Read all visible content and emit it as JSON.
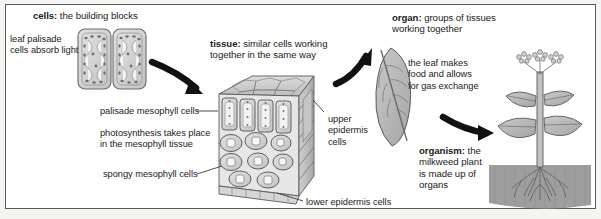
{
  "figure": {
    "background_color": "#ffffff",
    "border_color": "#5b5b58",
    "ink_color": "#1b1b1b",
    "arrow_color": "#111111",
    "art_gray": "#b4b4b4",
    "art_outline": "#5a5a5a",
    "soil_gray": "#9a9a9a"
  },
  "stages": {
    "cells": {
      "heading_term": "cells:",
      "heading_rest": " the building blocks",
      "note": "leaf palisade\ncells absorb light",
      "art_name": "palisade-cells-drawing"
    },
    "tissue": {
      "heading_term": "tissue:",
      "heading_rest": " similar cells  working\ntogether in the same way",
      "art_name": "leaf-tissue-block-drawing",
      "callouts": [
        {
          "name": "palisade-mesophyll-label",
          "text": "palisade mesophyll cells"
        },
        {
          "name": "photosynthesis-label",
          "text": "photosynthesis takes place\nin the mesophyll tissue"
        },
        {
          "name": "spongy-mesophyll-label",
          "text": "spongy mesophyll cells"
        },
        {
          "name": "upper-epidermis-label",
          "text": "upper\nepidermis\ncells"
        },
        {
          "name": "lower-epidermis-label",
          "text": "lower epidermis cells"
        }
      ]
    },
    "organ": {
      "heading_term": "organ:",
      "heading_rest": " groups of tissues\nworking together",
      "note": "the leaf makes\nfood and allows\nfor gas exchange",
      "art_name": "leaf-drawing"
    },
    "organism": {
      "heading_term": "organism:",
      "heading_rest": " the\nmilkweed plant\nis made up of\norgans",
      "art_name": "milkweed-plant-drawing"
    }
  },
  "arrows": [
    {
      "name": "arrow-cells-to-tissue",
      "from": "cells",
      "to": "tissue"
    },
    {
      "name": "arrow-tissue-to-organ",
      "from": "tissue",
      "to": "organ"
    },
    {
      "name": "arrow-organ-to-organism",
      "from": "organ",
      "to": "organism"
    }
  ]
}
